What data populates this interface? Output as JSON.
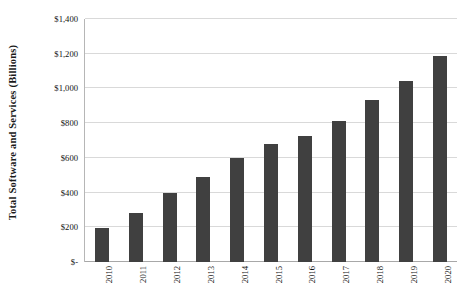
{
  "chart_data": {
    "type": "bar",
    "title": "",
    "xlabel": "",
    "ylabel": "Total Software and Services (Billions)",
    "categories": [
      "2010",
      "2011",
      "2012",
      "2013",
      "2014",
      "2015",
      "2016",
      "2017",
      "2018",
      "2019",
      "2020"
    ],
    "values": [
      195,
      285,
      395,
      490,
      600,
      680,
      725,
      815,
      935,
      1045,
      1185
    ],
    "ylim": [
      0,
      1400
    ],
    "ytick_values": [
      0,
      200,
      400,
      600,
      800,
      1000,
      1200,
      1400
    ],
    "ytick_labels": [
      "$-",
      "$200",
      "$400",
      "$600",
      "$800",
      "$1,000",
      "$1,200",
      "$1,400"
    ],
    "grid": true,
    "legend": "none",
    "bar_color": "#404040",
    "gridline_color": "#d9d9d9",
    "axis_color": "#a8a8a8",
    "background_color": "#ffffff"
  }
}
